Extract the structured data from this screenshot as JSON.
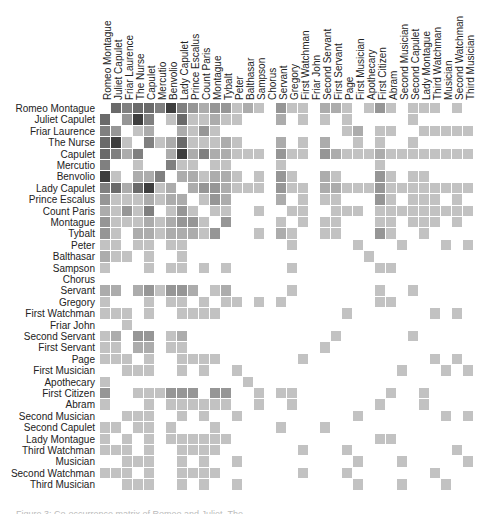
{
  "chart_data": {
    "type": "heatmap",
    "title": "",
    "row_labels": [
      "Romeo Montague",
      "Juliet Capulet",
      "Friar Laurence",
      "The Nurse",
      "Capulet",
      "Mercutio",
      "Benvolio",
      "Lady Capulet",
      "Prince Escalus",
      "Count Paris",
      "Montague",
      "Tybalt",
      "Peter",
      "Balthasar",
      "Sampson",
      "Chorus",
      "Servant",
      "Gregory",
      "First Watchman",
      "Friar John",
      "Second Servant",
      "First Servant",
      "Page",
      "First Musician",
      "Apothecary",
      "First Citizen",
      "Abram",
      "Second Musician",
      "Second Capulet",
      "Lady Montague",
      "Third Watchman",
      "Musician",
      "Second Watchman",
      "Third Musician"
    ],
    "col_labels": [
      "Romeo Montague",
      "Juliet Capulet",
      "Friar Laurence",
      "The Nurse",
      "Capulet",
      "Mercutio",
      "Benvolio",
      "Lady Capulet",
      "Prince Escalus",
      "Count Paris",
      "Montague",
      "Tybalt",
      "Peter",
      "Balthasar",
      "Sampson",
      "Chorus",
      "Servant",
      "Gregory",
      "First Watchman",
      "Friar John",
      "Second Servant",
      "First Servant",
      "Page",
      "First Musician",
      "Apothecary",
      "First Citizen",
      "Abram",
      "Second Musician",
      "Second Capulet",
      "Lady Montague",
      "Third Watchman",
      "Musician",
      "Second Watchman",
      "Third Musician"
    ],
    "color_scale": {
      "min": "#ffffff",
      "max": "#222222"
    },
    "matrix": [
      [
        0,
        6,
        5,
        6,
        6,
        5,
        8,
        5,
        4,
        3,
        4,
        4,
        2,
        3,
        2,
        0,
        4,
        2,
        2,
        0,
        3,
        3,
        2,
        0,
        2,
        4,
        2,
        0,
        2,
        2,
        2,
        0,
        2,
        0
      ],
      [
        6,
        0,
        4,
        8,
        5,
        0,
        2,
        6,
        2,
        2,
        3,
        2,
        2,
        0,
        0,
        0,
        3,
        0,
        2,
        0,
        2,
        0,
        2,
        0,
        0,
        0,
        0,
        0,
        2,
        0,
        0,
        0,
        0,
        0
      ],
      [
        5,
        4,
        0,
        2,
        3,
        0,
        0,
        3,
        2,
        4,
        2,
        0,
        0,
        0,
        0,
        0,
        0,
        0,
        0,
        0,
        0,
        0,
        2,
        3,
        0,
        2,
        2,
        0,
        0,
        2,
        2,
        2,
        2,
        2
      ],
      [
        6,
        8,
        2,
        0,
        5,
        2,
        3,
        6,
        2,
        2,
        2,
        3,
        2,
        0,
        0,
        0,
        3,
        0,
        2,
        0,
        3,
        0,
        0,
        2,
        0,
        2,
        0,
        0,
        2,
        0,
        0,
        0,
        0,
        0
      ],
      [
        6,
        5,
        3,
        5,
        0,
        0,
        3,
        8,
        3,
        5,
        3,
        3,
        2,
        2,
        2,
        0,
        4,
        2,
        2,
        0,
        4,
        3,
        2,
        2,
        2,
        3,
        2,
        2,
        2,
        2,
        2,
        2,
        2,
        2
      ],
      [
        5,
        0,
        0,
        2,
        0,
        0,
        5,
        2,
        2,
        0,
        2,
        2,
        0,
        0,
        0,
        0,
        2,
        0,
        0,
        0,
        0,
        0,
        0,
        0,
        0,
        2,
        0,
        0,
        0,
        0,
        0,
        0,
        0,
        0
      ],
      [
        8,
        2,
        0,
        3,
        3,
        5,
        0,
        3,
        3,
        2,
        3,
        3,
        2,
        0,
        2,
        0,
        4,
        2,
        0,
        0,
        3,
        2,
        0,
        0,
        0,
        4,
        2,
        0,
        2,
        2,
        0,
        0,
        0,
        0
      ],
      [
        5,
        6,
        3,
        6,
        8,
        2,
        3,
        0,
        3,
        4,
        4,
        3,
        2,
        2,
        2,
        0,
        4,
        2,
        2,
        0,
        3,
        3,
        2,
        2,
        2,
        4,
        2,
        2,
        2,
        2,
        2,
        2,
        2,
        2
      ],
      [
        4,
        2,
        2,
        2,
        3,
        2,
        3,
        3,
        0,
        2,
        4,
        3,
        0,
        0,
        0,
        0,
        3,
        0,
        2,
        0,
        2,
        2,
        0,
        0,
        0,
        4,
        2,
        0,
        2,
        2,
        2,
        0,
        2,
        0
      ],
      [
        3,
        2,
        4,
        2,
        5,
        0,
        2,
        4,
        2,
        0,
        2,
        2,
        0,
        0,
        2,
        0,
        0,
        2,
        2,
        0,
        0,
        2,
        2,
        2,
        0,
        2,
        2,
        2,
        2,
        2,
        2,
        2,
        2,
        2
      ],
      [
        4,
        2,
        2,
        2,
        3,
        2,
        3,
        4,
        4,
        2,
        0,
        4,
        0,
        0,
        0,
        0,
        2,
        0,
        2,
        0,
        2,
        2,
        0,
        0,
        0,
        2,
        2,
        0,
        2,
        2,
        2,
        0,
        2,
        0
      ],
      [
        4,
        2,
        0,
        3,
        3,
        2,
        3,
        3,
        3,
        2,
        4,
        0,
        0,
        0,
        2,
        0,
        3,
        2,
        0,
        0,
        2,
        2,
        0,
        0,
        0,
        4,
        2,
        0,
        0,
        2,
        0,
        0,
        0,
        0
      ],
      [
        2,
        2,
        0,
        2,
        2,
        0,
        2,
        2,
        0,
        0,
        0,
        0,
        0,
        0,
        0,
        0,
        0,
        2,
        0,
        0,
        0,
        0,
        0,
        2,
        0,
        0,
        0,
        2,
        0,
        0,
        0,
        2,
        0,
        2
      ],
      [
        3,
        2,
        2,
        0,
        2,
        0,
        0,
        2,
        0,
        0,
        0,
        0,
        0,
        0,
        0,
        0,
        0,
        0,
        0,
        0,
        0,
        0,
        0,
        0,
        2,
        0,
        0,
        0,
        0,
        0,
        0,
        0,
        0,
        0
      ],
      [
        2,
        0,
        0,
        0,
        2,
        0,
        2,
        2,
        0,
        2,
        0,
        2,
        0,
        0,
        0,
        0,
        0,
        2,
        0,
        0,
        0,
        0,
        0,
        0,
        0,
        2,
        2,
        0,
        0,
        0,
        0,
        0,
        0,
        0
      ],
      [
        0,
        0,
        0,
        0,
        0,
        0,
        0,
        0,
        0,
        0,
        0,
        0,
        0,
        0,
        0,
        0,
        0,
        0,
        0,
        0,
        0,
        0,
        0,
        0,
        0,
        0,
        0,
        0,
        0,
        0,
        0,
        0,
        0,
        0
      ],
      [
        3,
        3,
        0,
        3,
        4,
        2,
        4,
        4,
        3,
        0,
        2,
        3,
        0,
        0,
        0,
        0,
        0,
        2,
        0,
        0,
        0,
        0,
        0,
        0,
        0,
        2,
        0,
        0,
        2,
        0,
        0,
        0,
        0,
        0
      ],
      [
        2,
        0,
        0,
        0,
        2,
        0,
        2,
        2,
        0,
        2,
        0,
        2,
        2,
        0,
        2,
        0,
        2,
        0,
        0,
        0,
        0,
        0,
        0,
        0,
        0,
        2,
        2,
        0,
        0,
        0,
        0,
        0,
        0,
        0
      ],
      [
        2,
        2,
        2,
        0,
        2,
        0,
        0,
        2,
        2,
        2,
        2,
        0,
        0,
        0,
        0,
        0,
        0,
        0,
        0,
        0,
        0,
        0,
        2,
        0,
        0,
        0,
        0,
        0,
        0,
        0,
        2,
        0,
        2,
        0
      ],
      [
        0,
        0,
        2,
        0,
        0,
        0,
        0,
        0,
        0,
        0,
        0,
        0,
        0,
        0,
        0,
        0,
        0,
        0,
        0,
        0,
        0,
        0,
        0,
        0,
        0,
        0,
        0,
        0,
        0,
        0,
        0,
        0,
        0,
        0
      ],
      [
        2,
        3,
        0,
        4,
        4,
        0,
        2,
        3,
        0,
        0,
        0,
        0,
        0,
        0,
        0,
        0,
        0,
        0,
        0,
        0,
        0,
        2,
        0,
        0,
        0,
        0,
        0,
        0,
        2,
        0,
        0,
        0,
        0,
        0
      ],
      [
        2,
        2,
        0,
        3,
        3,
        0,
        2,
        2,
        0,
        0,
        0,
        0,
        0,
        0,
        0,
        0,
        0,
        0,
        0,
        0,
        2,
        0,
        0,
        0,
        0,
        0,
        0,
        0,
        0,
        0,
        0,
        0,
        0,
        0
      ],
      [
        2,
        2,
        2,
        0,
        2,
        0,
        0,
        2,
        2,
        2,
        2,
        0,
        0,
        0,
        0,
        0,
        0,
        0,
        2,
        0,
        0,
        0,
        0,
        0,
        0,
        0,
        0,
        0,
        0,
        0,
        2,
        0,
        2,
        0
      ],
      [
        0,
        0,
        2,
        2,
        2,
        0,
        0,
        2,
        0,
        2,
        0,
        0,
        2,
        0,
        0,
        0,
        0,
        0,
        0,
        0,
        0,
        0,
        0,
        0,
        0,
        0,
        0,
        2,
        0,
        0,
        0,
        2,
        0,
        2
      ],
      [
        2,
        0,
        0,
        0,
        0,
        0,
        0,
        0,
        0,
        0,
        0,
        0,
        0,
        2,
        0,
        0,
        0,
        0,
        0,
        0,
        0,
        0,
        0,
        0,
        0,
        0,
        0,
        0,
        0,
        0,
        0,
        0,
        0,
        0
      ],
      [
        4,
        0,
        0,
        2,
        2,
        2,
        4,
        4,
        4,
        0,
        4,
        4,
        0,
        0,
        2,
        0,
        2,
        2,
        0,
        0,
        0,
        0,
        0,
        0,
        0,
        0,
        2,
        0,
        0,
        2,
        0,
        0,
        0,
        0
      ],
      [
        2,
        0,
        0,
        0,
        2,
        0,
        2,
        2,
        2,
        2,
        2,
        2,
        0,
        0,
        2,
        0,
        0,
        2,
        0,
        0,
        0,
        0,
        0,
        0,
        0,
        2,
        0,
        0,
        0,
        2,
        0,
        0,
        0,
        0
      ],
      [
        0,
        0,
        2,
        2,
        2,
        0,
        0,
        2,
        0,
        2,
        0,
        0,
        2,
        0,
        0,
        0,
        0,
        0,
        0,
        0,
        0,
        0,
        0,
        2,
        0,
        0,
        0,
        0,
        0,
        0,
        0,
        2,
        0,
        2
      ],
      [
        2,
        2,
        0,
        2,
        2,
        0,
        2,
        0,
        0,
        0,
        2,
        0,
        0,
        0,
        0,
        0,
        2,
        0,
        0,
        0,
        2,
        0,
        0,
        0,
        0,
        0,
        0,
        0,
        0,
        0,
        0,
        0,
        0,
        0
      ],
      [
        2,
        0,
        2,
        0,
        2,
        0,
        2,
        2,
        2,
        2,
        2,
        2,
        0,
        0,
        0,
        0,
        0,
        0,
        0,
        0,
        0,
        0,
        0,
        0,
        0,
        2,
        2,
        0,
        0,
        0,
        0,
        0,
        0,
        0
      ],
      [
        2,
        2,
        2,
        0,
        2,
        0,
        0,
        2,
        2,
        2,
        2,
        0,
        0,
        0,
        0,
        0,
        0,
        0,
        2,
        0,
        0,
        0,
        2,
        0,
        0,
        0,
        0,
        0,
        0,
        0,
        0,
        0,
        2,
        0
      ],
      [
        0,
        0,
        2,
        2,
        2,
        0,
        0,
        2,
        0,
        2,
        0,
        0,
        2,
        0,
        0,
        0,
        0,
        0,
        0,
        0,
        0,
        0,
        0,
        2,
        0,
        0,
        0,
        2,
        0,
        0,
        0,
        0,
        0,
        2
      ],
      [
        2,
        2,
        2,
        0,
        2,
        0,
        0,
        2,
        2,
        2,
        2,
        0,
        0,
        0,
        0,
        0,
        0,
        0,
        2,
        0,
        0,
        0,
        2,
        0,
        0,
        0,
        0,
        0,
        0,
        0,
        2,
        0,
        0,
        0
      ],
      [
        0,
        0,
        2,
        2,
        2,
        0,
        0,
        2,
        0,
        2,
        0,
        0,
        2,
        0,
        0,
        0,
        0,
        0,
        0,
        0,
        0,
        0,
        0,
        2,
        0,
        0,
        0,
        2,
        0,
        0,
        0,
        2,
        0,
        0
      ]
    ],
    "legend": null,
    "grid": false
  },
  "caption": "Figure 3: Co-occurrence matrix of Romeo and Juliet. The ..."
}
